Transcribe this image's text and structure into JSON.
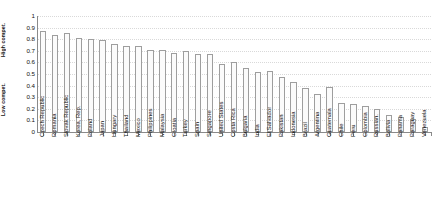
{
  "chart_data": {
    "type": "bar",
    "title": "",
    "subtitle": "",
    "xlabel": "",
    "ylabel": "",
    "ylabel_high": "High compet.",
    "ylabel_low": "Low compet.",
    "ylim": [
      0,
      1
    ],
    "ytick_labels": [
      "1",
      "0.9",
      "0.8",
      "0.7",
      "0.6",
      "0.5",
      "0.4",
      "0.3",
      "0.2",
      "0.1",
      "0"
    ],
    "ytick_values": [
      1,
      0.9,
      0.8,
      0.7,
      0.6,
      0.5,
      0.4,
      0.3,
      0.2,
      0.1,
      0
    ],
    "grid": true,
    "grid_axis": "y",
    "legend": "none",
    "bar_fill": "#fbfbfb",
    "bar_border": "#9e9e9e",
    "axis_color": "#8a8a8a",
    "categories": [
      "Czech Republic",
      "Romania",
      "Slovak Republic",
      "Korea, Rep.",
      "Poland",
      "Japan",
      "Hungary",
      "Thailand",
      "Mexico",
      "Philippines",
      "Malaysia",
      "Croatia",
      "Turkey",
      "Spain",
      "Singapore",
      "United States",
      "Costa Rica",
      "Bulgaria",
      "India",
      "El Salvador",
      "Pakistan",
      "Indonesia",
      "Brazil",
      "Argentina",
      "Guatemala",
      "Chile",
      "Peru",
      "Colombia",
      "Russian.",
      "Bolivia",
      "Panama",
      "Paraguay",
      "Venezuela"
    ],
    "values": [
      0.87,
      0.84,
      0.85,
      0.81,
      0.8,
      0.79,
      0.76,
      0.74,
      0.74,
      0.71,
      0.71,
      0.68,
      0.7,
      0.67,
      0.67,
      0.59,
      0.6,
      0.55,
      0.52,
      0.53,
      0.47,
      0.43,
      0.38,
      0.33,
      0.39,
      0.25,
      0.24,
      0.22,
      0.2,
      0.15,
      0.13,
      0.11,
      0.04
    ]
  }
}
